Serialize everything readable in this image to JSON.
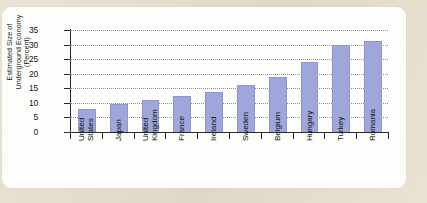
{
  "figure": {
    "panel_background": "#fdfdfb",
    "page_background": "#e7dfcd"
  },
  "chart_data": {
    "type": "bar",
    "title": "",
    "xlabel": "",
    "ylabel": "Estimated Size of Underground Economy (Percent)",
    "ylabel_lines": [
      "Estimated Size of",
      "Underground Economy",
      "(Percent)"
    ],
    "ylim": [
      0,
      35
    ],
    "yticks": [
      0,
      5,
      10,
      15,
      20,
      25,
      30,
      35
    ],
    "ytick_labels": [
      "0",
      "5",
      "10",
      "15",
      "20",
      "25",
      "30",
      "35"
    ],
    "grid": true,
    "grid_style": "dotted",
    "legend": "none",
    "bar_color": "#9fa6dc",
    "categories": [
      "United States",
      "Japan",
      "United Kingdom",
      "France",
      "Ireland",
      "Sweden",
      "Belgium",
      "Hungary",
      "Turkey",
      "Romania"
    ],
    "category_lines": [
      [
        "United",
        "States"
      ],
      [
        "Japan"
      ],
      [
        "United",
        "Kingdom"
      ],
      [
        "France"
      ],
      [
        "Ireland"
      ],
      [
        "Sweden"
      ],
      [
        "Belgium"
      ],
      [
        "Hungary"
      ],
      [
        "Turkey"
      ],
      [
        "Romania"
      ]
    ],
    "values": [
      7.4,
      9.4,
      10.8,
      12.1,
      13.3,
      15.8,
      18.4,
      23.7,
      29.5,
      30.8
    ]
  }
}
